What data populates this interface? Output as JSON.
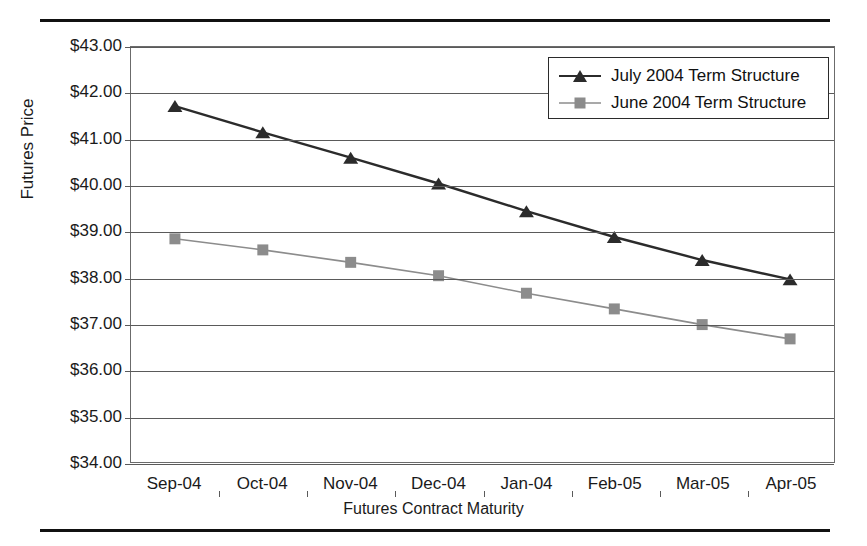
{
  "figure": {
    "clipped_header_text": "",
    "rules": {
      "top": true,
      "bottom": true
    }
  },
  "chart_data": {
    "type": "line",
    "title": "",
    "xlabel": "Futures Contract Maturity",
    "ylabel": "Futures Price",
    "categories": [
      "Sep-04",
      "Oct-04",
      "Nov-04",
      "Dec-04",
      "Jan-04",
      "Feb-05",
      "Mar-05",
      "Apr-05"
    ],
    "ylim": [
      34.0,
      43.0
    ],
    "ytick_values": [
      34.0,
      35.0,
      36.0,
      37.0,
      38.0,
      39.0,
      40.0,
      41.0,
      42.0,
      43.0
    ],
    "ytick_labels": [
      "$34.00",
      "$35.00",
      "$36.00",
      "$37.00",
      "$38.00",
      "$39.00",
      "$40.00",
      "$41.00",
      "$42.00",
      "$43.00"
    ],
    "grid": true,
    "grid_axis": "y",
    "legend_position": "top-right",
    "series": [
      {
        "name": "July 2004 Term Structure",
        "marker": "triangle",
        "color": "#2b2b2b",
        "values": [
          41.72,
          41.15,
          40.6,
          40.04,
          39.44,
          38.88,
          38.38,
          37.96
        ]
      },
      {
        "name": "June 2004 Term Structure",
        "marker": "square",
        "color": "#8c8c8c",
        "values": [
          38.84,
          38.6,
          38.33,
          38.04,
          37.66,
          37.32,
          36.98,
          36.67
        ]
      }
    ]
  },
  "legend": {
    "entries": [
      {
        "label": "July 2004 Term Structure",
        "marker": "triangle-marker",
        "color": "#2b2b2b"
      },
      {
        "label": "June 2004 Term Structure",
        "marker": "square-marker",
        "color": "#8c8c8c"
      }
    ]
  }
}
